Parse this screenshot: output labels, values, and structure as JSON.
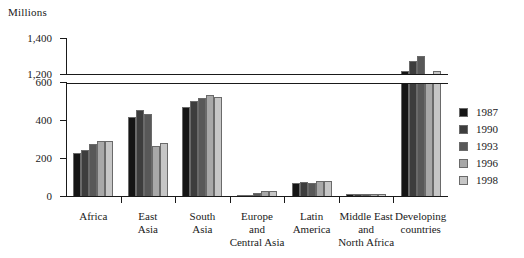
{
  "chart_data": {
    "type": "bar",
    "title": "",
    "subtitle": "",
    "xlabel": "",
    "ylabel": "Millions",
    "unit_label": "Millions",
    "grid": false,
    "legend_position": "right",
    "axis_break": {
      "from": 600,
      "to": 1200
    },
    "ylim": [
      0,
      1400
    ],
    "y_ticks": [
      {
        "value": 0,
        "label": "0"
      },
      {
        "value": 200,
        "label": "200"
      },
      {
        "value": 400,
        "label": "400"
      },
      {
        "value": 600,
        "label": "600"
      },
      {
        "value": 1200,
        "label": "1,200"
      },
      {
        "value": 1400,
        "label": "1,400"
      }
    ],
    "categories": [
      "Africa",
      "East\nAsia",
      "South\nAsia",
      "Europe\nand\nCentral Asia",
      "Latin\nAmerica",
      "Middle East\nand\nNorth Africa",
      "Developing\ncountries"
    ],
    "series": [
      {
        "name": "1987",
        "color": "#151515",
        "values": [
          225,
          415,
          470,
          5,
          70,
          10,
          1215
        ]
      },
      {
        "name": "1990",
        "color": "#3d3d3d",
        "values": [
          242,
          455,
          500,
          7,
          74,
          10,
          1275
        ]
      },
      {
        "name": "1993",
        "color": "#585858",
        "values": [
          273,
          430,
          515,
          18,
          70,
          10,
          1300
        ]
      },
      {
        "name": "1996",
        "color": "#a8a8a8",
        "values": [
          287,
          265,
          530,
          24,
          77,
          10,
          1200
        ]
      },
      {
        "name": "1998",
        "color": "#c6c6c6",
        "values": [
          291,
          278,
          522,
          24,
          78,
          11,
          1215
        ]
      }
    ],
    "legend_entries": [
      {
        "label": "1987",
        "color": "#151515"
      },
      {
        "label": "1990",
        "color": "#3d3d3d"
      },
      {
        "label": "1993",
        "color": "#585858"
      },
      {
        "label": "1996",
        "color": "#a8a8a8"
      },
      {
        "label": "1998",
        "color": "#c6c6c6"
      }
    ]
  }
}
